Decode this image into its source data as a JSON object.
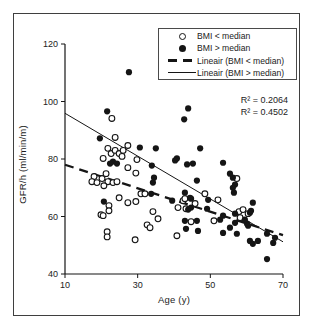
{
  "figure": {
    "background": "#ffffff",
    "border_color": "#3f3f3f",
    "ink_color": "#151515"
  },
  "chart_data": {
    "type": "scatter",
    "title": "",
    "xlabel": "Age (y)",
    "ylabel": "GFR/h (ml/min/m)",
    "xlim": [
      10,
      70
    ],
    "ylim": [
      40,
      120
    ],
    "xticks": [
      10,
      30,
      50,
      70
    ],
    "yticks": [
      40,
      60,
      80,
      100,
      120
    ],
    "grid": false,
    "legend": {
      "position": "top-right",
      "entries": [
        {
          "marker": "open-circle",
          "label": "BMI < median"
        },
        {
          "marker": "filled-circle",
          "label": "BMI > median"
        },
        {
          "marker": "dashed-line",
          "label": "Lineair (BMI < median)"
        },
        {
          "marker": "solid-line",
          "label": "Lineair (BMI > median)"
        }
      ]
    },
    "annotations": [
      {
        "text": "R² = 0.2064"
      },
      {
        "text": "R² = 0.4502"
      }
    ],
    "trendlines": [
      {
        "name": "Lineair (BMI < median)",
        "style": "dashed",
        "x1": 10,
        "y1": 78.0,
        "x2": 70,
        "y2": 53.5,
        "r2": 0.2064
      },
      {
        "name": "Lineair (BMI > median)",
        "style": "solid",
        "x1": 10,
        "y1": 95.9,
        "x2": 70,
        "y2": 51.2,
        "r2": 0.4502
      }
    ],
    "series": [
      {
        "name": "BMI < median",
        "marker": "open-circle",
        "points": [
          [
            22.9,
            94.1
          ],
          [
            23.8,
            87.5
          ],
          [
            27.3,
            84.7
          ],
          [
            29.8,
            79.8
          ],
          [
            20.5,
            80.2
          ],
          [
            22.7,
            81.9
          ],
          [
            23.8,
            83.0
          ],
          [
            24.9,
            81.9
          ],
          [
            26.0,
            83.0
          ],
          [
            25.7,
            80.9
          ],
          [
            21.8,
            83.7
          ],
          [
            18.0,
            73.9
          ],
          [
            17.4,
            72.1
          ],
          [
            18.8,
            71.8
          ],
          [
            20.2,
            73.2
          ],
          [
            21.3,
            74.9
          ],
          [
            21.8,
            72.1
          ],
          [
            23.2,
            71.8
          ],
          [
            24.3,
            72.1
          ],
          [
            20.7,
            70.7
          ],
          [
            27.3,
            77.0
          ],
          [
            29.5,
            75.1
          ],
          [
            30.9,
            67.9
          ],
          [
            32.0,
            67.9
          ],
          [
            22.1,
            63.8
          ],
          [
            22.1,
            62.0
          ],
          [
            24.9,
            66.5
          ],
          [
            27.3,
            64.8
          ],
          [
            29.5,
            65.2
          ],
          [
            19.9,
            60.6
          ],
          [
            20.5,
            60.3
          ],
          [
            32.6,
            57.1
          ],
          [
            21.6,
            54.7
          ],
          [
            21.6,
            52.9
          ],
          [
            29.3,
            51.9
          ],
          [
            34.2,
            61.7
          ],
          [
            33.4,
            56.1
          ],
          [
            35.6,
            59.2
          ],
          [
            41.1,
            63.1
          ],
          [
            43.3,
            62.7
          ],
          [
            42.5,
            65.5
          ],
          [
            45.8,
            64.5
          ],
          [
            48.5,
            67.9
          ],
          [
            52.1,
            65.8
          ],
          [
            44.7,
            58.2
          ],
          [
            51.0,
            58.5
          ],
          [
            40.8,
            53.3
          ],
          [
            43.0,
            66.2
          ],
          [
            57.3,
            73.2
          ],
          [
            57.9,
            61.7
          ],
          [
            59.0,
            62.4
          ],
          [
            58.2,
            59.6
          ],
          [
            60.4,
            61.0
          ]
        ]
      },
      {
        "name": "BMI > median",
        "marker": "filled-circle",
        "points": [
          [
            27.6,
            110.2
          ],
          [
            21.6,
            96.6
          ],
          [
            19.6,
            87.2
          ],
          [
            43.9,
            97.6
          ],
          [
            42.8,
            93.8
          ],
          [
            23.2,
            79.1
          ],
          [
            24.3,
            78.4
          ],
          [
            22.4,
            78.4
          ],
          [
            30.6,
            84.0
          ],
          [
            35.0,
            83.7
          ],
          [
            33.9,
            77.7
          ],
          [
            34.5,
            73.5
          ],
          [
            34.2,
            71.8
          ],
          [
            20.7,
            65.2
          ],
          [
            33.7,
            67.9
          ],
          [
            40.8,
            80.2
          ],
          [
            40.3,
            79.5
          ],
          [
            43.6,
            78.1
          ],
          [
            45.2,
            78.4
          ],
          [
            47.2,
            83.7
          ],
          [
            53.5,
            78.7
          ],
          [
            46.3,
            72.5
          ],
          [
            56.2,
            73.5
          ],
          [
            55.4,
            74.9
          ],
          [
            56.8,
            71.1
          ],
          [
            56.2,
            70.0
          ],
          [
            56.5,
            68.3
          ],
          [
            43.0,
            68.3
          ],
          [
            44.4,
            66.5
          ],
          [
            39.5,
            65.5
          ],
          [
            44.7,
            66.2
          ],
          [
            49.4,
            65.8
          ],
          [
            43.9,
            62.4
          ],
          [
            44.7,
            63.1
          ],
          [
            49.1,
            62.7
          ],
          [
            53.5,
            60.3
          ],
          [
            56.8,
            61.0
          ],
          [
            60.9,
            61.3
          ],
          [
            61.7,
            64.8
          ],
          [
            61.2,
            62.0
          ],
          [
            43.0,
            58.5
          ],
          [
            46.3,
            58.5
          ],
          [
            52.7,
            58.9
          ],
          [
            56.8,
            57.8
          ],
          [
            60.1,
            57.5
          ],
          [
            55.4,
            56.1
          ],
          [
            59.5,
            58.9
          ],
          [
            60.4,
            56.8
          ],
          [
            43.3,
            55.7
          ],
          [
            46.6,
            55.0
          ],
          [
            53.5,
            54.3
          ],
          [
            57.3,
            54.0
          ],
          [
            65.6,
            54.0
          ],
          [
            60.9,
            51.5
          ],
          [
            63.1,
            51.5
          ],
          [
            67.3,
            50.8
          ],
          [
            67.8,
            52.6
          ],
          [
            65.6,
            45.2
          ],
          [
            61.7,
            50.5
          ]
        ]
      }
    ]
  }
}
